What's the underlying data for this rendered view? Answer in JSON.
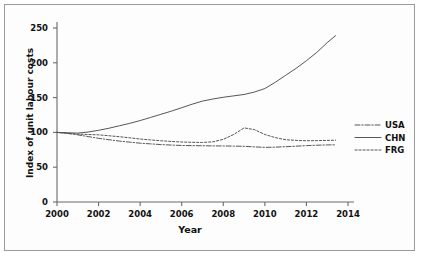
{
  "chart_data": {
    "type": "line",
    "title": "",
    "xlabel": "Year",
    "ylabel": "Index of unit labour costs",
    "xlim": [
      2000,
      2014
    ],
    "ylim": [
      0,
      250
    ],
    "grid": false,
    "legend_position": "right",
    "xticks": [
      "2000",
      "2002",
      "2004",
      "2006",
      "2008",
      "2010",
      "2012",
      "2014"
    ],
    "yticks": [
      "0",
      "50",
      "100",
      "150",
      "200",
      "250"
    ],
    "x": [
      2000,
      2000.5,
      2001,
      2001.5,
      2002,
      2002.5,
      2003,
      2003.5,
      2004,
      2004.5,
      2005,
      2005.5,
      2006,
      2006.5,
      2007,
      2007.5,
      2008,
      2008.5,
      2009,
      2009.5,
      2010,
      2010.5,
      2011,
      2011.5,
      2012,
      2012.5,
      2013,
      2013.4
    ],
    "series": [
      {
        "name": "USA",
        "style": "dashdot",
        "color": "#4d4d4d",
        "values": [
          100,
          98.5,
          96.5,
          94.0,
          91.5,
          89.5,
          87.5,
          86.0,
          84.5,
          83.5,
          82.5,
          81.8,
          81.2,
          81.0,
          80.8,
          80.6,
          80.5,
          80.3,
          80.0,
          79.2,
          78.5,
          78.8,
          79.5,
          80.2,
          81.0,
          81.6,
          82.0,
          82.2
        ]
      },
      {
        "name": "CHN",
        "style": "solid",
        "color": "#4d4d4d",
        "values": [
          100,
          99.5,
          99.0,
          100.5,
          103.0,
          106.0,
          109.5,
          113.0,
          117.0,
          121.5,
          126.0,
          130.5,
          135.5,
          140.5,
          145.0,
          148.0,
          150.5,
          152.5,
          154.5,
          158.0,
          163.0,
          172.0,
          182.0,
          192.0,
          203.0,
          215.0,
          229.0,
          239.0
        ]
      },
      {
        "name": "FRG",
        "style": "dotted",
        "color": "#4d4d4d",
        "values": [
          100,
          98.8,
          97.5,
          97.0,
          96.5,
          95.2,
          93.8,
          92.2,
          90.5,
          89.2,
          88.0,
          87.0,
          86.2,
          85.8,
          85.5,
          86.5,
          90.0,
          97.0,
          106.5,
          104.0,
          97.0,
          92.5,
          89.5,
          88.5,
          88.0,
          88.2,
          88.5,
          88.8
        ]
      }
    ]
  }
}
